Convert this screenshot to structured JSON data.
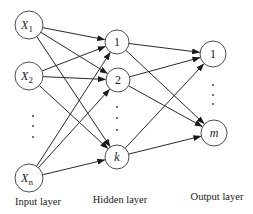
{
  "diagram": {
    "type": "feedforward-neural-network",
    "colors": {
      "stroke": "#2a2a2a",
      "node_fill": "#ffffff",
      "text": "#1a1a1a"
    },
    "layers": [
      {
        "id": "input",
        "label": "Input layer",
        "label_pos": [
          38,
          205
        ],
        "nodes": [
          {
            "id": "x1",
            "main": "X",
            "sub": "1",
            "italic": true,
            "cx": 29,
            "cy": 25,
            "r": 14
          },
          {
            "id": "x2",
            "main": "X",
            "sub": "2",
            "italic": true,
            "cx": 29,
            "cy": 76,
            "r": 14
          },
          {
            "id": "xn",
            "main": "X",
            "sub": "n",
            "italic": true,
            "cx": 29,
            "cy": 178,
            "r": 14
          }
        ],
        "ellipsis_dots": [
          [
            33,
            116
          ],
          [
            33,
            126
          ],
          [
            33,
            137
          ]
        ]
      },
      {
        "id": "hidden",
        "label": "Hidden layer",
        "label_pos": [
          120,
          203
        ],
        "nodes": [
          {
            "id": "h1",
            "main": "1",
            "italic": false,
            "cx": 117,
            "cy": 42,
            "r": 12
          },
          {
            "id": "h2",
            "main": "2",
            "italic": false,
            "cx": 118,
            "cy": 80,
            "r": 12
          },
          {
            "id": "hk",
            "main": "k",
            "italic": true,
            "cx": 117,
            "cy": 157,
            "r": 12
          }
        ],
        "ellipsis_dots": [
          [
            117,
            107
          ],
          [
            117,
            118
          ],
          [
            117,
            130
          ]
        ]
      },
      {
        "id": "output",
        "label": "Output layer",
        "label_pos": [
          217,
          200
        ],
        "nodes": [
          {
            "id": "o1",
            "main": "1",
            "italic": false,
            "cx": 213,
            "cy": 54,
            "r": 13
          },
          {
            "id": "om",
            "main": "m",
            "italic": true,
            "cx": 214,
            "cy": 133,
            "r": 13
          }
        ],
        "ellipsis_dots": [
          [
            213,
            85
          ],
          [
            213,
            95
          ],
          [
            213,
            104
          ]
        ]
      }
    ],
    "connections": "fully-connected"
  }
}
